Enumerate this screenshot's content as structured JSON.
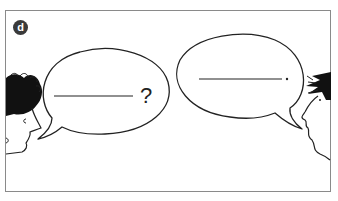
{
  "panel": {
    "label": "d",
    "border_color": "#8a8a8a",
    "badge_color": "#3a3a3a"
  },
  "left_speaker": {
    "hair": "curly-black",
    "bubble": {
      "blank": "__________",
      "punctuation": "?"
    }
  },
  "right_speaker": {
    "hair": "spiky-black",
    "bubble": {
      "blank": "__________",
      "punctuation": "."
    }
  }
}
